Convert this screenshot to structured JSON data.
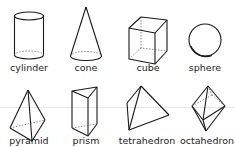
{
  "shapes": [
    {
      "name": "cylinder",
      "label": "cylinder"
    },
    {
      "name": "cone",
      "label": "cone"
    },
    {
      "name": "cube",
      "label": "cube"
    },
    {
      "name": "sphere",
      "label": "sphere"
    },
    {
      "name": "pyramid",
      "label": "pyramid"
    },
    {
      "name": "prism",
      "label": "prism"
    },
    {
      "name": "tetrahedron",
      "label": "tetrahedron"
    },
    {
      "name": "octahedron",
      "label": "octahedron"
    }
  ],
  "colors": {
    "stroke": "#1a1a1a",
    "background": "#ffffff"
  }
}
